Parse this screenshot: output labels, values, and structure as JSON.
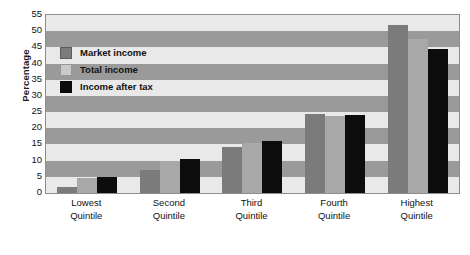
{
  "chart_data": {
    "type": "bar",
    "title": "",
    "xlabel": "",
    "ylabel": "Percentage",
    "ylim": [
      0,
      55
    ],
    "ytick_step": 5,
    "yticks": [
      0,
      5,
      10,
      15,
      20,
      25,
      30,
      35,
      40,
      45,
      50,
      55
    ],
    "grid": "horizontal-banded",
    "legend_position": "inside-top-left",
    "categories": [
      "Lowest Quintile",
      "Second Quintile",
      "Third Quintile",
      "Fourth Quintile",
      "Highest Quintile"
    ],
    "category_lines": [
      [
        "Lowest",
        "Quintile"
      ],
      [
        "Second",
        "Quintile"
      ],
      [
        "Third",
        "Quintile"
      ],
      [
        "Fourth",
        "Quintile"
      ],
      [
        "Highest",
        "Quintile"
      ]
    ],
    "series": [
      {
        "name": "Market income",
        "color": "#7b7b7b",
        "values": [
          2.0,
          7.1,
          14.3,
          24.3,
          52.0
        ]
      },
      {
        "name": "Total income",
        "color": "#a8a8a8",
        "values": [
          4.6,
          9.9,
          15.3,
          23.8,
          47.5
        ]
      },
      {
        "name": "Income after tax",
        "color": "#0c0c0c",
        "values": [
          5.0,
          10.6,
          16.2,
          24.2,
          44.5
        ]
      }
    ]
  },
  "legend": {
    "items": [
      {
        "label": "Market income",
        "swatch": "market"
      },
      {
        "label": "Total income",
        "swatch": "total"
      },
      {
        "label": "Income after tax",
        "swatch": "aftertax"
      }
    ]
  },
  "axes": {
    "y_title": "Percentage"
  }
}
